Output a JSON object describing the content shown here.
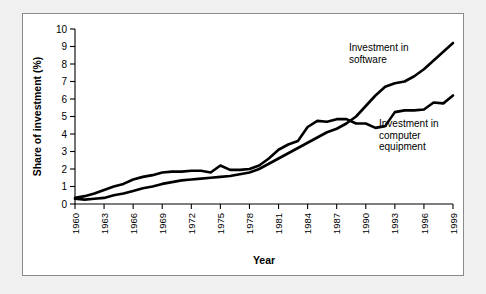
{
  "figure": {
    "background_color": "#f0f0f0",
    "panel_color": "#ffffff",
    "border_color": "#8a8a8a",
    "line_color": "#000000"
  },
  "chart_data": {
    "type": "line",
    "title": "",
    "subtitle": "",
    "xlabel": "Year",
    "ylabel": "Share of investment (%)",
    "xlim": [
      1960,
      1999
    ],
    "ylim": [
      0,
      10
    ],
    "grid": false,
    "legend_position": "inline-annotations",
    "ytick_labels": [
      "0",
      "1",
      "2",
      "3",
      "4",
      "5",
      "6",
      "7",
      "8",
      "9",
      "10"
    ],
    "ytick_values": [
      0,
      1,
      2,
      3,
      4,
      5,
      6,
      7,
      8,
      9,
      10
    ],
    "xtick_labels": [
      "1960",
      "1963",
      "1966",
      "1969",
      "1972",
      "1975",
      "1978",
      "1981",
      "1984",
      "1987",
      "1990",
      "1993",
      "1996",
      "1999"
    ],
    "xtick_values": [
      1960,
      1963,
      1966,
      1969,
      1972,
      1975,
      1978,
      1981,
      1984,
      1987,
      1990,
      1993,
      1996,
      1999
    ],
    "x": [
      1960,
      1961,
      1962,
      1963,
      1964,
      1965,
      1966,
      1967,
      1968,
      1969,
      1970,
      1971,
      1972,
      1973,
      1974,
      1975,
      1976,
      1977,
      1978,
      1979,
      1980,
      1981,
      1982,
      1983,
      1984,
      1985,
      1986,
      1987,
      1988,
      1989,
      1990,
      1991,
      1992,
      1993,
      1994,
      1995,
      1996,
      1997,
      1998,
      1999
    ],
    "series": [
      {
        "name": "Investment in software",
        "annotation": "Investment in\nsoftware",
        "values": [
          0.3,
          0.25,
          0.3,
          0.35,
          0.5,
          0.6,
          0.75,
          0.9,
          1.0,
          1.15,
          1.25,
          1.35,
          1.4,
          1.45,
          1.5,
          1.55,
          1.6,
          1.7,
          1.8,
          2.0,
          2.3,
          2.6,
          2.9,
          3.2,
          3.5,
          3.8,
          4.1,
          4.3,
          4.6,
          5.0,
          5.6,
          6.2,
          6.7,
          6.9,
          7.0,
          7.3,
          7.7,
          8.2,
          8.7,
          9.2
        ]
      },
      {
        "name": "Investment in computer equipment",
        "annotation": "Investment in\ncomputer\nequipment",
        "values": [
          0.35,
          0.45,
          0.6,
          0.8,
          1.0,
          1.15,
          1.4,
          1.55,
          1.65,
          1.8,
          1.85,
          1.85,
          1.9,
          1.9,
          1.8,
          2.2,
          1.95,
          1.95,
          2.0,
          2.2,
          2.6,
          3.1,
          3.4,
          3.6,
          4.4,
          4.75,
          4.7,
          4.85,
          4.85,
          4.6,
          4.6,
          4.35,
          4.45,
          5.25,
          5.35,
          5.35,
          5.4,
          5.8,
          5.75,
          6.2
        ]
      }
    ],
    "annotations": [
      {
        "text_lines": [
          "Investment in",
          "software"
        ],
        "x_px": 348,
        "y_px": 50
      },
      {
        "text_lines": [
          "Investment in",
          "computer",
          "equipment"
        ],
        "x_px": 378,
        "y_px": 126
      }
    ]
  }
}
